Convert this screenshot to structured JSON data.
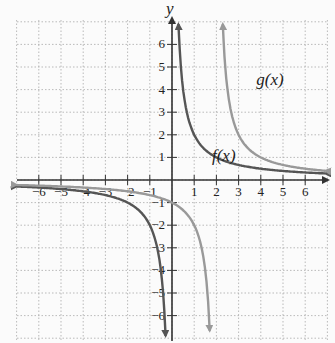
{
  "chart_data": {
    "type": "line",
    "title": "",
    "xlabel": "x",
    "ylabel": "y",
    "xlim": [
      -7,
      7
    ],
    "ylim": [
      -7,
      7
    ],
    "grid": true,
    "x_ticks": [
      -6,
      -5,
      -4,
      -3,
      -2,
      -1,
      1,
      2,
      3,
      4,
      5,
      6
    ],
    "y_ticks": [
      -6,
      -5,
      -4,
      -3,
      -2,
      -1,
      1,
      2,
      3,
      4,
      5,
      6
    ],
    "series": [
      {
        "name": "f(x)",
        "color": "#555555",
        "formula": "2/x",
        "vertical_asymptote": 0,
        "horizontal_asymptote": 0
      },
      {
        "name": "g(x)",
        "color": "#999999",
        "formula": "2/(x-2)",
        "vertical_asymptote": 2,
        "horizontal_asymptote": 0
      }
    ],
    "annotations": [
      {
        "text": "f(x)",
        "x": 1.8,
        "y": 1.0
      },
      {
        "text": "g(x)",
        "x": 3.8,
        "y": 4.3
      }
    ]
  },
  "labels": {
    "y_axis": "y",
    "f": "f(x)",
    "g": "g(x)"
  }
}
